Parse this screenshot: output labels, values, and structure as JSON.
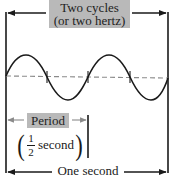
{
  "diagram": {
    "cycles_label": {
      "line1": "Two cycles",
      "line2": "(or two hertz)"
    },
    "period_label": "Period",
    "period_value": {
      "numerator": "1",
      "denominator": "2",
      "unit": "second",
      "open_paren": "(",
      "close_paren": ")"
    },
    "duration_label": "One second",
    "wave": {
      "cycles": 2,
      "stroke_color": "#1a1a1a",
      "midline_color": "#8a8a8a",
      "label_bg_color": "#b9b9b9"
    }
  }
}
